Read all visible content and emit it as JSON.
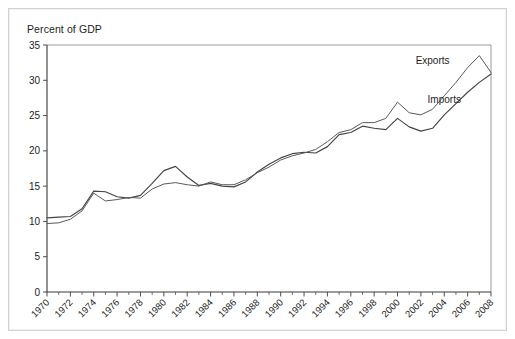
{
  "chart_data": {
    "type": "line",
    "title": "Percent of GDP",
    "xlabel": "",
    "ylabel": "",
    "ylim": [
      0,
      35
    ],
    "ytick_step": 5,
    "yticks": [
      "0",
      "5",
      "10",
      "15",
      "20",
      "25",
      "30",
      "35"
    ],
    "xlim": [
      1970,
      2008
    ],
    "xtick_step": 2,
    "grid": false,
    "legend_position": "inline-annotation",
    "annotations": [
      {
        "text": "Exports",
        "x": 2003,
        "y": 32.3
      },
      {
        "text": "Imports",
        "x": 2004,
        "y": 26.8
      }
    ],
    "x": [
      1970,
      1971,
      1972,
      1973,
      1974,
      1975,
      1976,
      1977,
      1978,
      1979,
      1980,
      1981,
      1982,
      1983,
      1984,
      1985,
      1986,
      1987,
      1988,
      1989,
      1990,
      1991,
      1992,
      1993,
      1994,
      1995,
      1996,
      1997,
      1998,
      1999,
      2000,
      2001,
      2002,
      2003,
      2004,
      2005,
      2006,
      2007,
      2008
    ],
    "xtick_labels": [
      "1970",
      "1972",
      "1974",
      "1976",
      "1978",
      "1980",
      "1982",
      "1984",
      "1986",
      "1988",
      "1990",
      "1992",
      "1994",
      "1996",
      "1998",
      "2000",
      "2002",
      "2004",
      "2006",
      "2008"
    ],
    "series": [
      {
        "name": "Exports",
        "values": [
          10.5,
          10.6,
          10.7,
          11.8,
          14.3,
          14.2,
          13.5,
          13.3,
          13.7,
          15.4,
          17.2,
          17.8,
          16.3,
          15.1,
          15.4,
          15.0,
          14.9,
          15.6,
          17.0,
          18.1,
          19.0,
          19.6,
          19.8,
          19.7,
          20.6,
          22.3,
          22.6,
          23.5,
          23.2,
          23.0,
          24.6,
          23.4,
          22.8,
          23.2,
          25.1,
          26.7,
          28.3,
          29.7,
          30.9
        ]
      },
      {
        "name": "Imports",
        "values": [
          9.7,
          9.8,
          10.3,
          11.5,
          14.0,
          12.9,
          13.1,
          13.4,
          13.3,
          14.6,
          15.3,
          15.5,
          15.2,
          15.0,
          15.6,
          15.2,
          15.2,
          15.9,
          16.9,
          17.7,
          18.7,
          19.3,
          19.7,
          20.2,
          21.3,
          22.6,
          23.0,
          24.0,
          24.0,
          24.6,
          26.9,
          25.4,
          25.1,
          25.9,
          27.8,
          29.7,
          31.8,
          33.5,
          31.1
        ]
      }
    ]
  },
  "annotations_text": {
    "exports": "Exports",
    "imports": "Imports"
  }
}
